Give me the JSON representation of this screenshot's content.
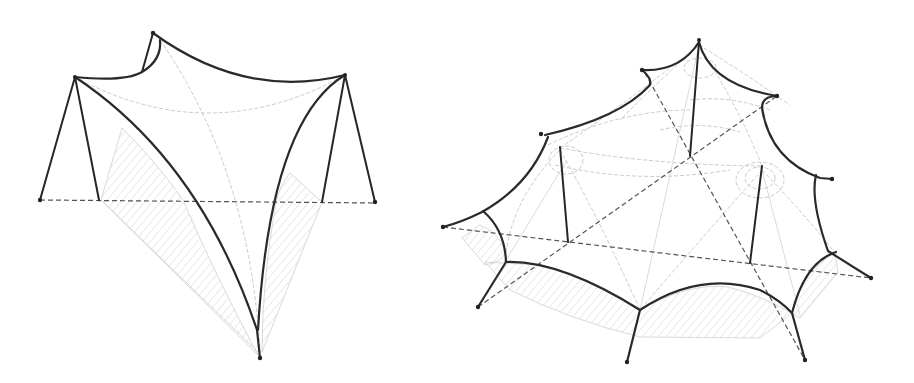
{
  "figure": {
    "colors": {
      "background": "#ffffff",
      "edge_cable": "#2a2a2a",
      "mast": "#262626",
      "dashed_axis": "#555555",
      "membrane_guide": "#c4c4c4",
      "hatch": "#c8c8c8"
    },
    "drawings": [
      {
        "id": "left",
        "label": "four-point hypar membrane",
        "anchor_points": [
          {
            "name": "top-peak",
            "x": 153,
            "y": 33
          },
          {
            "name": "left-mast-top",
            "x": 75,
            "y": 77
          },
          {
            "name": "right-mast-top",
            "x": 345,
            "y": 75
          },
          {
            "name": "bottom-anchor",
            "x": 260,
            "y": 358
          },
          {
            "name": "left-ground",
            "x": 40,
            "y": 200
          },
          {
            "name": "right-ground",
            "x": 375,
            "y": 202
          }
        ]
      },
      {
        "id": "right",
        "label": "multi-mast membrane canopy",
        "anchor_points": [
          {
            "name": "top-peak",
            "x": 699,
            "y": 40
          },
          {
            "name": "upper-left",
            "x": 642,
            "y": 70
          },
          {
            "name": "upper-right",
            "x": 777,
            "y": 96
          },
          {
            "name": "left",
            "x": 541,
            "y": 134
          },
          {
            "name": "right",
            "x": 832,
            "y": 179
          },
          {
            "name": "far-left",
            "x": 443,
            "y": 227
          },
          {
            "name": "far-right",
            "x": 871,
            "y": 278
          },
          {
            "name": "bottom-left",
            "x": 478,
            "y": 307
          },
          {
            "name": "bottom-mid",
            "x": 627,
            "y": 362
          },
          {
            "name": "bottom-right",
            "x": 805,
            "y": 360
          }
        ],
        "mast_count": 3
      }
    ]
  }
}
